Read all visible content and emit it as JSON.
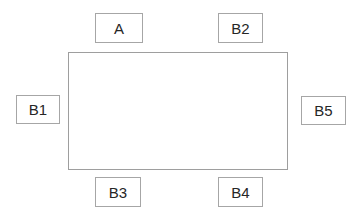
{
  "diagram": {
    "type": "block-diagram",
    "background_color": "#ffffff",
    "box_border_color": "#a6a6a6",
    "box_fill_color": "#ffffff",
    "text_color": "#262626",
    "container": {
      "name": "main-rectangle",
      "label": "",
      "border_color": "#9e9e9e",
      "fill_color": "#ffffff"
    },
    "nodes": [
      {
        "id": "a",
        "label": "A",
        "position": "top-left"
      },
      {
        "id": "b2",
        "label": "B2",
        "position": "top-right"
      },
      {
        "id": "b1",
        "label": "B1",
        "position": "left"
      },
      {
        "id": "b5",
        "label": "B5",
        "position": "right"
      },
      {
        "id": "b3",
        "label": "B3",
        "position": "bottom-left"
      },
      {
        "id": "b4",
        "label": "B4",
        "position": "bottom-right"
      }
    ]
  }
}
